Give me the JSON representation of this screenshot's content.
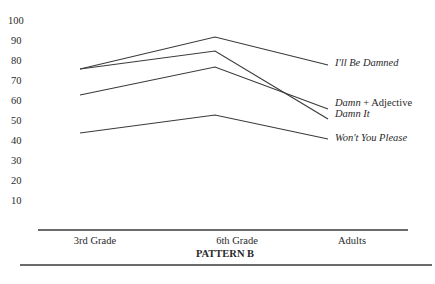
{
  "chart_data": {
    "type": "line",
    "title": "PATTERN B",
    "xlabel": "",
    "ylabel": "",
    "categories": [
      "3rd Grade",
      "6th Grade",
      "Adults"
    ],
    "yticks": [
      10,
      20,
      30,
      40,
      50,
      60,
      70,
      80,
      90,
      100
    ],
    "ylim": [
      0,
      100
    ],
    "grid": false,
    "legend_position": "right, inline at line ends",
    "series": [
      {
        "name": "I'll Be Damned",
        "values": [
          76,
          92,
          78
        ]
      },
      {
        "name": "Damn It",
        "values": [
          76,
          85,
          51
        ]
      },
      {
        "name": "Damn + Adjective",
        "values": [
          63,
          77,
          56
        ]
      },
      {
        "name": "Won't You Please",
        "values": [
          44,
          53,
          41
        ]
      }
    ]
  },
  "labels": {
    "yticks": [
      "100",
      "90",
      "80",
      "70",
      "60",
      "50",
      "40",
      "30",
      "20",
      "10"
    ],
    "xticks": [
      "3rd Grade",
      "6th Grade",
      "Adults"
    ],
    "title": "PATTERN B",
    "legend": {
      "ill_be_damned": "I'll Be Damned",
      "damn_adjective_italic": "Damn",
      "damn_adjective_rest": " + Adjective",
      "damn_it": "Damn It",
      "wont_you_please": "Won't You Please"
    }
  }
}
